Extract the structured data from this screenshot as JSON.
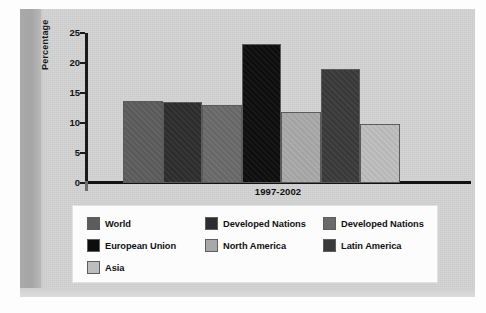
{
  "figure": {
    "background_color": "#d4d4d4",
    "gutter_color": "#a9a9a9"
  },
  "chart_data": {
    "type": "bar",
    "title": "",
    "subtitle": "",
    "xlabel": "1997-2002",
    "ylabel": "Percentage",
    "categories": [
      "1997-2002"
    ],
    "ylim": [
      0,
      25
    ],
    "yticks": [
      0,
      5,
      10,
      15,
      20,
      25
    ],
    "grid": false,
    "legend_position": "bottom",
    "series": [
      {
        "name": "World",
        "values": [
          13.6
        ],
        "color": "#5c5c5c"
      },
      {
        "name": "Developed Nations",
        "values": [
          13.5
        ],
        "color": "#2d2d2d"
      },
      {
        "name": "Developed Nations",
        "values": [
          13.0
        ],
        "color": "#6a6a6a"
      },
      {
        "name": "European Union",
        "values": [
          23.1
        ],
        "color": "#0d0d0d"
      },
      {
        "name": "North America",
        "values": [
          11.8
        ],
        "color": "#a8a8a8"
      },
      {
        "name": "Latin America",
        "values": [
          19.0
        ],
        "color": "#3a3a3a"
      },
      {
        "name": "Asia",
        "values": [
          9.8
        ],
        "color": "#bdbdbd"
      }
    ]
  },
  "axis": {
    "y_label": "Percentage",
    "x_label": "1997-2002",
    "y_ticks": [
      "25",
      "20",
      "15",
      "10",
      "5",
      "0"
    ]
  },
  "legend": {
    "entries": [
      {
        "label": "World",
        "color": "#5c5c5c"
      },
      {
        "label": "Developed Nations",
        "color": "#2d2d2d"
      },
      {
        "label": "Developed Nations",
        "color": "#6a6a6a"
      },
      {
        "label": "European Union",
        "color": "#0d0d0d"
      },
      {
        "label": "North America",
        "color": "#a8a8a8"
      },
      {
        "label": "Latin America",
        "color": "#3a3a3a"
      },
      {
        "label": "Asia",
        "color": "#bdbdbd"
      }
    ]
  }
}
